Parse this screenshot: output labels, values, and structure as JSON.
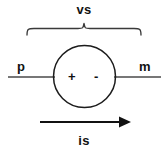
{
  "figure": {
    "type": "circuit-diagram",
    "title_label": "vs",
    "width": 168,
    "height": 154,
    "background_color": "#ffffff",
    "stroke_color": "#111111",
    "labels": {
      "source_voltage": "vs",
      "source_current": "is",
      "terminal_left": "p",
      "terminal_right": "m",
      "polarity_positive": "+",
      "polarity_negative": "-"
    },
    "elements": {
      "brace": {
        "name": "voltage-span-brace",
        "spans_label": "vs"
      },
      "source": {
        "name": "voltage-source-circle",
        "positive_side": "left",
        "negative_side": "right"
      },
      "wire_left": {
        "name": "left-terminal-wire",
        "terminal": "p"
      },
      "wire_right": {
        "name": "right-terminal-wire",
        "terminal": "m"
      },
      "current_arrow": {
        "name": "current-direction-arrow",
        "direction": "right",
        "label": "is"
      }
    }
  }
}
